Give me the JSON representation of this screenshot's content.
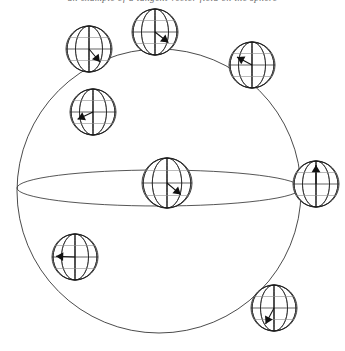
{
  "figure": {
    "caption_text": "an example of a tangent vector field on the sphere",
    "background_color": "#ffffff",
    "line_color": "#2b2b2b",
    "globe_line_color": "#1c1c1c",
    "arrow_color": "#111111"
  },
  "main_sphere": {
    "label": "main-sphere",
    "center_x": 159,
    "center_y": 191,
    "radius": 142,
    "equator": {
      "label": "equator-ellipse",
      "center_x": 159,
      "center_y": 188,
      "radius_x": 142,
      "radius_y": 18
    }
  },
  "globe_style": {
    "meridian_count": 5,
    "parallel_count": 3,
    "radius": 23
  },
  "globes": [
    {
      "id": "globe-top-left",
      "name": "globe-marker-top-left",
      "cx": 89,
      "cy": 49,
      "r": 23,
      "arrow_angle_deg": 50,
      "arrow_length": 17,
      "arrow_label": "vector-down-right"
    },
    {
      "id": "globe-top-center",
      "name": "globe-marker-top-center",
      "cx": 155,
      "cy": 32,
      "r": 23,
      "arrow_angle_deg": 38,
      "arrow_length": 17,
      "arrow_label": "vector-down-right"
    },
    {
      "id": "globe-top-right",
      "name": "globe-marker-top-right",
      "cx": 252,
      "cy": 65,
      "r": 23,
      "arrow_angle_deg": 208,
      "arrow_length": 17,
      "arrow_label": "vector-up-left"
    },
    {
      "id": "globe-upper-left-inner",
      "name": "globe-marker-upper-left-inner",
      "cx": 93,
      "cy": 112,
      "r": 23,
      "arrow_angle_deg": 155,
      "arrow_length": 17,
      "arrow_label": "vector-down-left"
    },
    {
      "id": "globe-center-equator",
      "name": "globe-marker-center-equator",
      "cx": 167,
      "cy": 183,
      "r": 25,
      "arrow_angle_deg": 40,
      "arrow_length": 18,
      "arrow_label": "vector-up-right"
    },
    {
      "id": "globe-right-equator",
      "name": "globe-marker-right-equator",
      "cx": 316,
      "cy": 184,
      "r": 23,
      "arrow_angle_deg": 270,
      "arrow_length": 19,
      "arrow_label": "vector-up"
    },
    {
      "id": "globe-lower-left-inner",
      "name": "globe-marker-lower-left-inner",
      "cx": 75,
      "cy": 257,
      "r": 23,
      "arrow_angle_deg": 182,
      "arrow_length": 19,
      "arrow_label": "vector-left"
    },
    {
      "id": "globe-bottom-right",
      "name": "globe-marker-bottom-right",
      "cx": 274,
      "cy": 308,
      "r": 23,
      "arrow_angle_deg": 118,
      "arrow_length": 18,
      "arrow_label": "vector-down-left"
    }
  ]
}
